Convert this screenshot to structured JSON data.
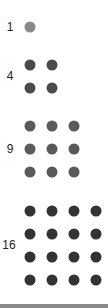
{
  "groups": [
    {
      "label": "1",
      "count": 1,
      "rows": 1,
      "cols": 1,
      "color": "#8a8a8a",
      "label_x": 10,
      "label_y": 27,
      "dot_x": [
        30
      ],
      "dot_y": [
        27
      ]
    },
    {
      "label": "4",
      "count": 4,
      "rows": 2,
      "cols": 2,
      "color": "#4a4a4a",
      "label_x": 10,
      "label_y": 76,
      "dot_x": [
        30,
        52
      ],
      "dot_y": [
        65,
        88
      ]
    },
    {
      "label": "9",
      "count": 9,
      "rows": 3,
      "cols": 3,
      "color": "#5a5a5a",
      "label_x": 10,
      "label_y": 149,
      "dot_x": [
        30,
        52,
        74
      ],
      "dot_y": [
        126,
        149,
        172
      ]
    },
    {
      "label": "16",
      "count": 16,
      "rows": 4,
      "cols": 4,
      "color": "#333333",
      "label_x": 9,
      "label_y": 245,
      "dot_x": [
        30,
        52,
        74,
        96
      ],
      "dot_y": [
        211,
        234,
        257,
        280
      ]
    }
  ],
  "bottom_bar_color": "#8a8a8a"
}
